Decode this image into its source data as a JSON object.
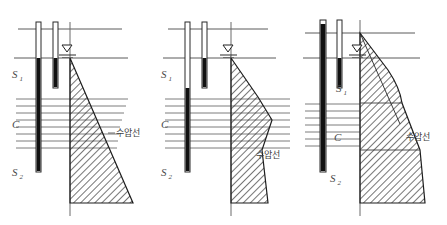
{
  "figure": {
    "type": "engineering-diagram",
    "panel_count": 3,
    "background_color": "#ffffff",
    "line_color": "#5a5a5a",
    "dark_line_color": "#111111",
    "hatch_color": "#2b2b2b",
    "label_color": "#4a4a4a"
  },
  "labels": {
    "layer_top": "S",
    "layer_top_sub": "1",
    "layer_mid": "C",
    "layer_bottom": "S",
    "layer_bottom_sub": "2",
    "pressure_line": "수압선"
  },
  "panels": [
    {
      "id": "panel-left",
      "index": 1,
      "origin_x": 6,
      "width": 140,
      "ground_line_y": 58,
      "top_line_y": 29,
      "clay_top_y": 97,
      "clay_bottom_y": 150,
      "base_y": 203,
      "axis_x": 70,
      "labels": {
        "s1_x": 12,
        "s1_y": 78,
        "c_x": 12,
        "c_y": 128,
        "s2_x": 12,
        "s2_y": 176,
        "ko_x": 116,
        "ko_y": 136
      },
      "piezometers": [
        {
          "x": 36,
          "width": 5,
          "top_y": 22,
          "fill_top_y": 58,
          "bottom_y": 172
        },
        {
          "x": 53,
          "width": 5,
          "top_y": 22,
          "fill_top_y": 58,
          "bottom_y": 88
        }
      ],
      "water_table": {
        "x": 70,
        "y": 50
      },
      "pressure_shape": "triangle-widening",
      "pressure_points": "70,58 70,203 133,203",
      "shape_note": "linear hydrostatic triangle increasing with depth"
    },
    {
      "id": "panel-middle",
      "index": 2,
      "origin_x": 155,
      "width": 140,
      "ground_line_y": 58,
      "top_line_y": 29,
      "clay_top_y": 97,
      "clay_bottom_y": 150,
      "base_y": 203,
      "axis_x": 231,
      "labels": {
        "s1_x": 161,
        "s1_y": 78,
        "c_x": 161,
        "c_y": 128,
        "s2_x": 161,
        "s2_y": 176,
        "ko_x": 256,
        "ko_y": 158
      },
      "piezometers": [
        {
          "x": 185,
          "width": 5,
          "top_y": 22,
          "fill_top_y": 88,
          "bottom_y": 172
        },
        {
          "x": 202,
          "width": 5,
          "top_y": 22,
          "fill_top_y": 58,
          "bottom_y": 88
        }
      ],
      "water_table": {
        "x": 231,
        "y": 50
      },
      "pressure_shape": "bulged-then-narrowing",
      "pressure_points": "231,58 231,203 268,203 262,150 272,120 258,97",
      "shape_note": "pressure bulges through clay layer then reduces"
    },
    {
      "id": "panel-right",
      "index": 3,
      "origin_x": 300,
      "width": 147,
      "ground_line_y": 58,
      "top_line_y": 33,
      "clay_top_y": 103,
      "clay_bottom_y": 150,
      "base_y": 203,
      "axis_x": 360,
      "labels": {
        "s1_x": 336,
        "s1_y": 92,
        "c_x": 334,
        "c_y": 141,
        "s2_x": 330,
        "s2_y": 182,
        "ko_x": 406,
        "ko_y": 140
      },
      "piezometers": [
        {
          "x": 320,
          "width": 6,
          "top_y": 20,
          "fill_top_y": 24,
          "bottom_y": 172
        },
        {
          "x": 337,
          "width": 5,
          "top_y": 20,
          "fill_top_y": 58,
          "bottom_y": 88
        }
      ],
      "water_table": {
        "x": 360,
        "y": 50
      },
      "pressure_shape": "curved-maximum",
      "pressure_points": "360,33 360,203 425,203 420,150 402,103 388,70",
      "reference_line": "360,33 398,120",
      "shape_note": "largest pressure diagram with curved boundary and straight reference line"
    }
  ]
}
